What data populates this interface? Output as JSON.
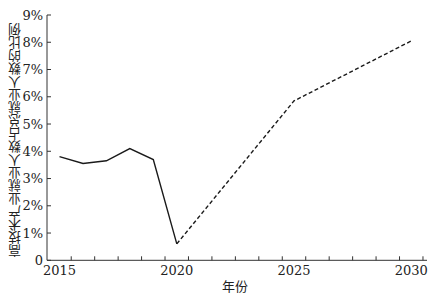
{
  "chart_data": {
    "type": "line",
    "title": "",
    "xlabel": "年份",
    "ylabel": "高技术产业就业人数占总就业人数的比例",
    "ylim": [
      0,
      9
    ],
    "xlim": [
      2015,
      2030
    ],
    "yticks": [
      "0",
      "1%",
      "2%",
      "3%",
      "4%",
      "5%",
      "6%",
      "7%",
      "8%",
      "9%"
    ],
    "xticks_labels": [
      "2015",
      "2020",
      "2025",
      "2030"
    ],
    "grid": false,
    "legend": null,
    "series": [
      {
        "name": "historical",
        "style": "solid",
        "x": [
          2015,
          2016,
          2017,
          2018,
          2019,
          2020
        ],
        "values": [
          3.8,
          3.55,
          3.65,
          4.1,
          3.7,
          0.6
        ]
      },
      {
        "name": "projection",
        "style": "dashed",
        "x": [
          2020,
          2025,
          2030
        ],
        "values": [
          0.6,
          5.85,
          8.05
        ]
      }
    ],
    "colors": {
      "line": "#1a1a1a",
      "axis": "#333333"
    }
  }
}
